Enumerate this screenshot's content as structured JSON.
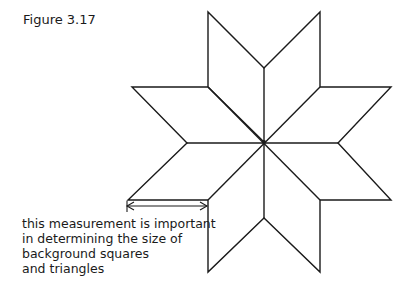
{
  "figure": {
    "title": "Figure 3.17",
    "annotation": {
      "lines": [
        "this measurement is important",
        "in determining the size of",
        "background squares",
        "and triangles"
      ]
    },
    "shape": "eight-pointed star of diamonds",
    "colors": {
      "stroke": "#1a1a1a",
      "background": "#ffffff"
    }
  }
}
